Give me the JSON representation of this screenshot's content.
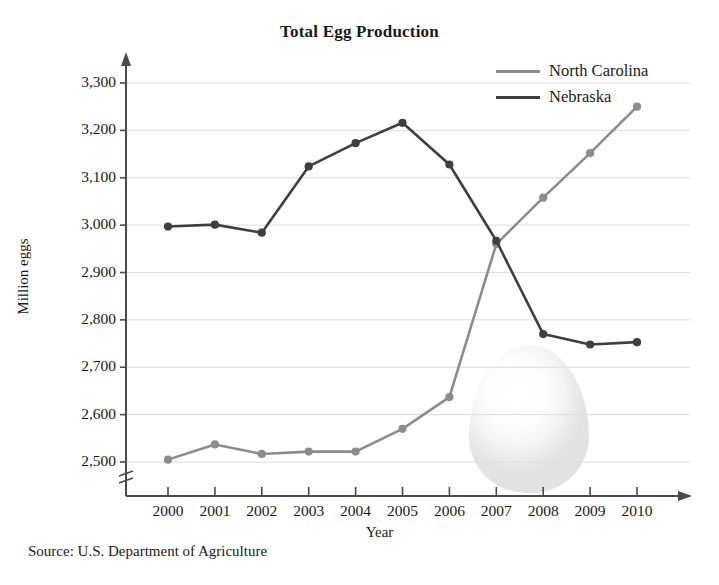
{
  "chart_data": {
    "type": "line",
    "title": "Total Egg Production",
    "xlabel": "Year",
    "ylabel": "Million eggs",
    "x": [
      2000,
      2001,
      2002,
      2003,
      2004,
      2005,
      2006,
      2007,
      2008,
      2009,
      2010
    ],
    "xtick_labels": [
      "2000",
      "2001",
      "2002",
      "2003",
      "2004",
      "2005",
      "2006",
      "2007",
      "2008",
      "2009",
      "2010"
    ],
    "ytick_labels": [
      "2,500",
      "2,600",
      "2,700",
      "2,800",
      "2,900",
      "3,000",
      "3,100",
      "3,200",
      "3,300"
    ],
    "ytick_values": [
      2500,
      2600,
      2700,
      2800,
      2900,
      3000,
      3100,
      3200,
      3300
    ],
    "ylim": [
      2500,
      3300
    ],
    "xlim": [
      2000,
      2010
    ],
    "axis_break": true,
    "grid": "horizontal",
    "legend_position": "top-right",
    "markers": "filled-circle",
    "series": [
      {
        "name": "North Carolina",
        "color": "#8c8c8c",
        "values": [
          2505,
          2537,
          2517,
          2522,
          2522,
          2570,
          2637,
          2960,
          3058,
          3152,
          3250
        ]
      },
      {
        "name": "Nebraska",
        "color": "#3f3f3f",
        "values": [
          2997,
          3001,
          2984,
          3124,
          3173,
          3216,
          3128,
          2967,
          2770,
          2748,
          2753
        ]
      }
    ],
    "annotations": {
      "source": "Source: U.S. Department of Agriculture",
      "decoration": "egg-watermark"
    }
  },
  "colors": {
    "axis": "#4a4a4a",
    "grid": "#dcdcdc",
    "text": "#1a1a1a",
    "background": "#ffffff"
  }
}
